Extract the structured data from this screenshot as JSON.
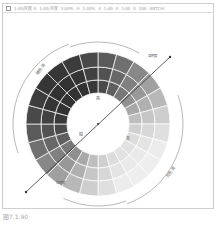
{
  "toolbar": {
    "items": [
      "1:00/灰度 A",
      "1:00/灰度",
      "1:00%",
      "H",
      "1:00%",
      "4",
      "1:00",
      "0",
      "1:00",
      "0",
      "200",
      "ANTCHI"
    ]
  },
  "diagram": {
    "type": "tone-wheel",
    "segments": 24,
    "rings": 3,
    "center_label": "",
    "labels": {
      "top": "亮",
      "left": "暗",
      "right_bottom": "灰",
      "upper_left_bracket": "暗色调",
      "upper_right_tag": "高明度",
      "lower_left_tag": "低明度",
      "lower_right_bracket": "亮色调"
    },
    "colors": {
      "darkest": "#3a3a3a",
      "lightest": "#ececec",
      "line": "#333333",
      "bracket": "#888888"
    }
  },
  "caption": "图7.1.90"
}
